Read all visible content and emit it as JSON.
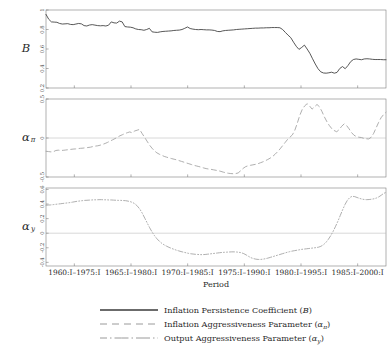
{
  "chart_data": {
    "type": "line",
    "title": "",
    "xlabel": "Period",
    "grid": false,
    "legend_position": "bottom",
    "panels": [
      {
        "ylabel": "B",
        "ylabel_plain": "B",
        "ylim": [
          0.2,
          1.0
        ],
        "yticks": [
          0.2,
          0.4,
          0.6,
          0.8,
          1
        ],
        "ytick_labels": [
          "0.2",
          "0.4",
          "0.6",
          "0.8",
          "1"
        ],
        "series_name": "Inflation Persistence Coefficient (B)",
        "line_style": "solid",
        "color": "#3a3a3a",
        "values": [
          0.955,
          0.905,
          0.878,
          0.876,
          0.874,
          0.862,
          0.856,
          0.858,
          0.86,
          0.852,
          0.85,
          0.856,
          0.862,
          0.858,
          0.84,
          0.836,
          0.846,
          0.85,
          0.845,
          0.84,
          0.838,
          0.84,
          0.836,
          0.844,
          0.878,
          0.868,
          0.866,
          0.886,
          0.878,
          0.83,
          0.826,
          0.824,
          0.818,
          0.806,
          0.8,
          0.798,
          0.792,
          0.8,
          0.812,
          0.776,
          0.772,
          0.77,
          0.776,
          0.78,
          0.782,
          0.784,
          0.786,
          0.79,
          0.792,
          0.794,
          0.8,
          0.812,
          0.826,
          0.81,
          0.804,
          0.8,
          0.798,
          0.8,
          0.798,
          0.796,
          0.796,
          0.794,
          0.79,
          0.78,
          0.778,
          0.786,
          0.79,
          0.792,
          0.794,
          0.796,
          0.8,
          0.802,
          0.804,
          0.806,
          0.808,
          0.81,
          0.812,
          0.814,
          0.814,
          0.816,
          0.816,
          0.818,
          0.818,
          0.82,
          0.82,
          0.82,
          0.818,
          0.8,
          0.77,
          0.742,
          0.716,
          0.67,
          0.628,
          0.596,
          0.616,
          0.64,
          0.6,
          0.556,
          0.5,
          0.446,
          0.398,
          0.366,
          0.354,
          0.352,
          0.356,
          0.362,
          0.352,
          0.36,
          0.4,
          0.42,
          0.398,
          0.43,
          0.47,
          0.492,
          0.498,
          0.494,
          0.49,
          0.498,
          0.5,
          0.498,
          0.494,
          0.492,
          0.492,
          0.492,
          0.49,
          0.49
        ]
      },
      {
        "ylabel": "alpha_pi",
        "ylabel_plain": "α",
        "ylabel_sub": "π",
        "ylim": [
          -0.5,
          0.5
        ],
        "yticks": [
          -0.5,
          0,
          0.5
        ],
        "ytick_labels": [
          "-0.5",
          "0",
          "0.5"
        ],
        "series_name": "Inflation Aggressiveness Parameter (α_π)",
        "line_style": "dashed",
        "color": "#9a9a9a",
        "values": [
          -0.17,
          -0.174,
          -0.178,
          -0.176,
          -0.16,
          -0.156,
          -0.16,
          -0.158,
          -0.154,
          -0.15,
          -0.146,
          -0.142,
          -0.14,
          -0.136,
          -0.132,
          -0.13,
          -0.126,
          -0.122,
          -0.118,
          -0.11,
          -0.104,
          -0.1,
          -0.092,
          -0.082,
          -0.07,
          -0.056,
          -0.04,
          -0.024,
          -0.008,
          0.01,
          0.028,
          0.042,
          0.056,
          0.068,
          0.078,
          0.066,
          0.09,
          0.1,
          0.11,
          0.058,
          0.01,
          -0.04,
          -0.09,
          -0.13,
          -0.164,
          -0.19,
          -0.208,
          -0.222,
          -0.236,
          -0.246,
          -0.256,
          -0.264,
          -0.272,
          -0.28,
          -0.29,
          -0.3,
          -0.31,
          -0.32,
          -0.33,
          -0.34,
          -0.35,
          -0.358,
          -0.366,
          -0.374,
          -0.384,
          -0.392,
          -0.398,
          -0.402,
          -0.408,
          -0.414,
          -0.42,
          -0.428,
          -0.438,
          -0.446,
          -0.452,
          -0.456,
          -0.458,
          -0.456,
          -0.448,
          -0.42,
          -0.39,
          -0.368,
          -0.356,
          -0.35,
          -0.344,
          -0.338,
          -0.33,
          -0.318,
          -0.306,
          -0.292,
          -0.276,
          -0.258,
          -0.236,
          -0.208,
          -0.176,
          -0.14,
          -0.1,
          -0.06,
          -0.02,
          0.01,
          0.04,
          0.1,
          0.19,
          0.29,
          0.366,
          0.412,
          0.44,
          0.41,
          0.37,
          0.4,
          0.43,
          0.4,
          0.34,
          0.27,
          0.21,
          0.16,
          0.12,
          0.095,
          0.08,
          0.108,
          0.15,
          0.18,
          0.16,
          0.118,
          0.07,
          0.036,
          0.018,
          0.01,
          0.006,
          -0.004,
          -0.01,
          -0.012,
          0.01,
          0.06,
          0.13,
          0.2,
          0.26,
          0.3,
          0.33
        ]
      },
      {
        "ylabel": "alpha_y",
        "ylabel_plain": "α",
        "ylabel_sub": "y",
        "ylim": [
          -0.45,
          0.62
        ],
        "yticks": [
          -0.4,
          -0.2,
          0,
          0.2,
          0.4,
          0.6
        ],
        "ytick_labels": [
          "-0.4",
          "-0.2",
          "0",
          "0.2",
          "0.4",
          "0.6"
        ],
        "series_name": "Output Aggressiveness Parameter (α_y)",
        "line_style": "dashdotdot",
        "color": "#9a9a9a",
        "values": [
          0.384,
          0.386,
          0.388,
          0.392,
          0.396,
          0.4,
          0.404,
          0.408,
          0.412,
          0.416,
          0.42,
          0.426,
          0.432,
          0.438,
          0.442,
          0.446,
          0.45,
          0.452,
          0.454,
          0.456,
          0.458,
          0.458,
          0.46,
          0.46,
          0.458,
          0.458,
          0.456,
          0.456,
          0.454,
          0.452,
          0.45,
          0.45,
          0.448,
          0.446,
          0.44,
          0.432,
          0.42,
          0.4,
          0.368,
          0.326,
          0.27,
          0.204,
          0.138,
          0.074,
          0.016,
          -0.034,
          -0.076,
          -0.11,
          -0.138,
          -0.16,
          -0.178,
          -0.194,
          -0.208,
          -0.22,
          -0.232,
          -0.242,
          -0.252,
          -0.26,
          -0.268,
          -0.276,
          -0.282,
          -0.286,
          -0.29,
          -0.292,
          -0.294,
          -0.294,
          -0.292,
          -0.288,
          -0.284,
          -0.28,
          -0.276,
          -0.272,
          -0.268,
          -0.264,
          -0.262,
          -0.26,
          -0.258,
          -0.256,
          -0.256,
          -0.258,
          -0.262,
          -0.268,
          -0.28,
          -0.298,
          -0.318,
          -0.336,
          -0.348,
          -0.356,
          -0.36,
          -0.36,
          -0.356,
          -0.35,
          -0.342,
          -0.332,
          -0.322,
          -0.312,
          -0.302,
          -0.292,
          -0.282,
          -0.272,
          -0.262,
          -0.254,
          -0.246,
          -0.24,
          -0.234,
          -0.228,
          -0.222,
          -0.218,
          -0.214,
          -0.21,
          -0.206,
          -0.202,
          -0.198,
          -0.192,
          -0.18,
          -0.16,
          -0.13,
          -0.088,
          -0.038,
          0.02,
          0.088,
          0.16,
          0.24,
          0.32,
          0.394,
          0.452,
          0.49,
          0.506,
          0.502,
          0.49,
          0.478,
          0.468,
          0.462,
          0.46,
          0.462,
          0.466,
          0.472,
          0.482,
          0.498,
          0.52,
          0.545,
          0.56
        ]
      }
    ],
    "xtick_labels": [
      "1960:I–1975:I",
      "1965:I–1980:I",
      "1970:I–1985:I",
      "1975:I–1990:I",
      "1980:I–1995:I",
      "1985:I–2000:I"
    ],
    "legend": [
      {
        "label": "Inflation Persistence Coefficient (B)",
        "style": "solid",
        "color": "#3a3a3a"
      },
      {
        "label": "Inflation Aggressiveness Parameter (απ)",
        "style": "dashed",
        "color": "#9a9a9a"
      },
      {
        "label": "Output Aggressiveness Parameter (αy)",
        "style": "dashdotdot",
        "color": "#9a9a9a"
      }
    ]
  },
  "legend_items": [
    {
      "text_main": "Inflation Persistence Coefficient (",
      "text_sym": "B",
      "text_sub": "",
      "text_tail": ")"
    },
    {
      "text_main": "Inflation Aggressiveness Parameter (",
      "text_sym": "α",
      "text_sub": "π",
      "text_tail": ")"
    },
    {
      "text_main": "Output Aggressiveness Parameter (",
      "text_sym": "α",
      "text_sub": "y",
      "text_tail": ")"
    }
  ],
  "axis": {
    "xlabel": "Period"
  }
}
